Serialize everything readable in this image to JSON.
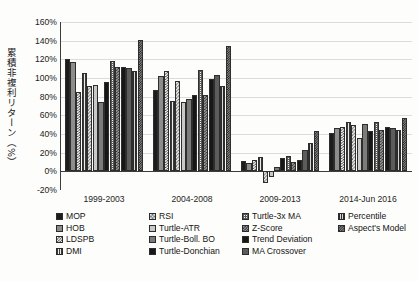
{
  "chart_data": {
    "type": "bar",
    "title": "",
    "xlabel": "",
    "ylabel": "累積非複利リターン（%）",
    "ylim": [
      -20,
      160
    ],
    "ytick_labels": [
      "160%",
      "140%",
      "120%",
      "100%",
      "80%",
      "60%",
      "40%",
      "20%",
      "0%",
      "-20%"
    ],
    "ytick_values": [
      160,
      140,
      120,
      100,
      80,
      60,
      40,
      20,
      0,
      -20
    ],
    "grid": true,
    "legend_position": "bottom",
    "unit": "%",
    "categories": [
      "1999-2003",
      "2004-2008",
      "2009-2013",
      "2014-Jun 2016"
    ],
    "series": [
      {
        "name": "MOP",
        "swatch": "p-dot-dark",
        "values": [
          120,
          87,
          11,
          41
        ]
      },
      {
        "name": "HOB",
        "swatch": "p-solid-gray",
        "values": [
          117,
          102,
          9,
          46
        ]
      },
      {
        "name": "LDSPB",
        "swatch": "p-check-lt",
        "values": [
          85,
          108,
          12,
          48
        ]
      },
      {
        "name": "DMI",
        "swatch": "p-vline",
        "values": [
          105,
          75,
          15,
          53
        ]
      },
      {
        "name": "RSI",
        "swatch": "p-check-md",
        "values": [
          91,
          97,
          -13,
          50
        ]
      },
      {
        "name": "Turtle-ATR",
        "swatch": "p-lightgray",
        "values": [
          93,
          74,
          -6,
          36
        ]
      },
      {
        "name": "Turtle-Boll. BO",
        "swatch": "p-midgray",
        "values": [
          74,
          78,
          5,
          51
        ]
      },
      {
        "name": "Turtle-Donchian",
        "swatch": "p-black",
        "values": [
          96,
          82,
          14,
          43
        ]
      },
      {
        "name": "Turtle-3x MA",
        "swatch": "p-fine-grid",
        "values": [
          118,
          109,
          16,
          53
        ]
      },
      {
        "name": "Z-Score",
        "swatch": "p-check-dk",
        "values": [
          112,
          82,
          10,
          44
        ]
      },
      {
        "name": "Trend Deviation",
        "swatch": "p-black",
        "values": [
          112,
          99,
          12,
          47
        ]
      },
      {
        "name": "MA Crossover",
        "swatch": "p-gray-dk",
        "values": [
          111,
          103,
          23,
          46
        ]
      },
      {
        "name": "Percentile",
        "swatch": "p-vline-dk",
        "values": [
          107,
          91,
          30,
          44
        ]
      },
      {
        "name": "Aspect's Model",
        "swatch": "p-check-hv",
        "values": [
          141,
          134,
          43,
          57
        ]
      }
    ]
  },
  "legend": {
    "items": [
      {
        "label": "MOP",
        "swatch": "p-dot-dark"
      },
      {
        "label": "HOB",
        "swatch": "p-solid-gray"
      },
      {
        "label": "LDSPB",
        "swatch": "p-check-lt"
      },
      {
        "label": "DMI",
        "swatch": "p-vline"
      },
      {
        "label": "RSI",
        "swatch": "p-check-md"
      },
      {
        "label": "Turtle-ATR",
        "swatch": "p-lightgray"
      },
      {
        "label": "Turtle-Boll. BO",
        "swatch": "p-midgray"
      },
      {
        "label": "Turtle-Donchian",
        "swatch": "p-black"
      },
      {
        "label": "Turtle-3x MA",
        "swatch": "p-fine-grid"
      },
      {
        "label": "Z-Score",
        "swatch": "p-check-dk"
      },
      {
        "label": "Trend Deviation",
        "swatch": "p-black"
      },
      {
        "label": "MA Crossover",
        "swatch": "p-gray-dk"
      },
      {
        "label": "Percentile",
        "swatch": "p-vline-dk"
      },
      {
        "label": "Aspect's Model",
        "swatch": "p-check-hv"
      }
    ]
  }
}
